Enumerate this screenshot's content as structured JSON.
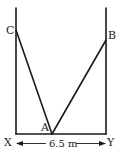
{
  "diagram": {
    "type": "ladder-between-walls",
    "points": {
      "C": {
        "label": "C",
        "x": 16,
        "y": 30
      },
      "B": {
        "label": "B",
        "x": 106,
        "y": 40
      },
      "A": {
        "label": "A",
        "x": 52,
        "y": 134
      },
      "X": {
        "label": "X",
        "x": 16,
        "y": 134
      },
      "Y": {
        "label": "Y",
        "x": 106,
        "y": 134
      }
    },
    "segments": [
      {
        "from": "C",
        "to": "A"
      },
      {
        "from": "A",
        "to": "B"
      },
      {
        "from": "X",
        "to": "Y"
      }
    ],
    "walls": [
      {
        "name": "left-wall",
        "x": 16,
        "y_top": 8,
        "y_bottom": 134
      },
      {
        "name": "right-wall",
        "x": 106,
        "y_top": 8,
        "y_bottom": 134
      }
    ],
    "dimension": {
      "from": "X",
      "to": "Y",
      "label": "6.5 m"
    }
  }
}
